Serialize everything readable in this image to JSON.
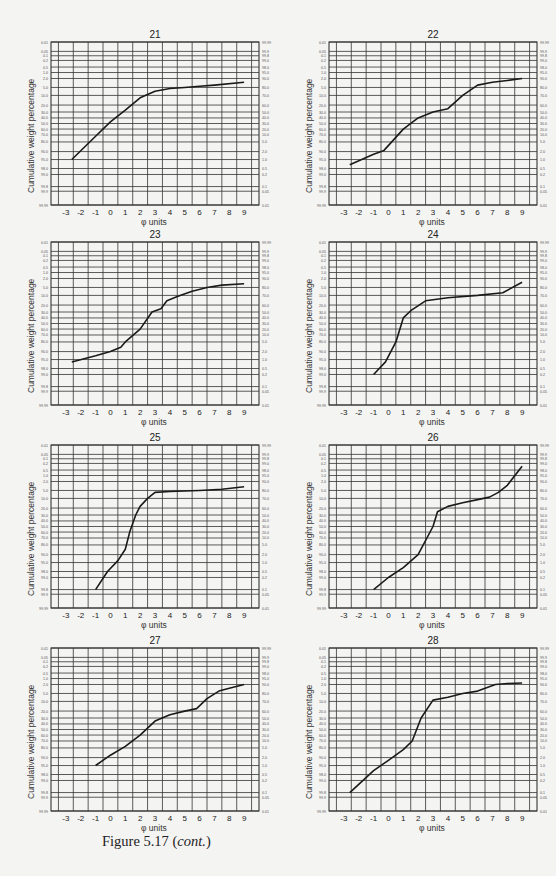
{
  "figure": {
    "caption_main": "Figure 5.17 (",
    "caption_italic": "cont.",
    "caption_end": ")",
    "colors": {
      "background": "#f4f4f2",
      "grid": "#333333",
      "curve": "#1a1a1a"
    }
  },
  "axes_common": {
    "ylabel": "Cumulative weight percentage",
    "xlabel": "φ units",
    "x_ticks": [
      -3,
      -2,
      -1,
      0,
      1,
      2,
      3,
      4,
      5,
      6,
      7,
      8,
      9
    ],
    "x_range": [
      -4,
      10
    ],
    "left_ticks": [
      "0.01",
      "0.05",
      "0.1",
      "0.2",
      "0.5",
      "1.0",
      "2.0",
      "5.0",
      "10.0",
      "20.0",
      "30.0",
      "40.0",
      "50.0",
      "60.0",
      "70.0",
      "80.0",
      "90.0",
      "95.0",
      "98.0",
      "99.0",
      "99.8",
      "99.9",
      "99.99"
    ],
    "right_ticks": [
      "99.99",
      "99.9",
      "99.8",
      "99.0",
      "98.0",
      "95.0",
      "90.0",
      "80.0",
      "70.0",
      "60.0",
      "50.0",
      "40.0",
      "30.0",
      "20.0",
      "10.0",
      "5.0",
      "2.0",
      "1.0",
      "0.5",
      "0.2",
      "0.1",
      "0.05",
      "0.01"
    ],
    "grid": true,
    "scale": "probability"
  },
  "chart_data": [
    {
      "type": "line",
      "title": "21",
      "xlabel": "φ units",
      "ylabel": "Cumulative weight percentage",
      "x": [
        -2.6,
        -1,
        0,
        1,
        2,
        3,
        4,
        5,
        6,
        7,
        9
      ],
      "values": [
        95,
        72,
        47,
        27,
        12,
        7,
        5.5,
        5,
        4.5,
        4,
        3
      ]
    },
    {
      "type": "line",
      "title": "22",
      "xlabel": "φ units",
      "ylabel": "Cumulative weight percentage",
      "x": [
        -2.6,
        -1,
        -0.3,
        1,
        2,
        3,
        4,
        5,
        6,
        7,
        8,
        9
      ],
      "values": [
        97,
        92,
        89,
        60,
        40,
        30,
        25,
        10,
        4,
        3,
        2.5,
        2
      ]
    },
    {
      "type": "line",
      "title": "23",
      "xlabel": "φ units",
      "ylabel": "Cumulative weight percentage",
      "x": [
        -2.6,
        -1,
        0,
        0.7,
        1,
        2,
        2.8,
        3.4,
        3.8,
        4.5,
        5.5,
        6.5,
        7.5,
        9
      ],
      "values": [
        96,
        93,
        90,
        86,
        80,
        60,
        30,
        25,
        15,
        11,
        7,
        5,
        4,
        3.5
      ]
    },
    {
      "type": "line",
      "title": "24",
      "xlabel": "φ units",
      "ylabel": "Cumulative weight percentage",
      "x": [
        -1,
        -0.2,
        0.5,
        1,
        1.5,
        2.5,
        4,
        6,
        7.7,
        9
      ],
      "values": [
        99,
        96,
        80,
        40,
        28,
        15,
        12,
        10,
        8,
        3
      ]
    },
    {
      "type": "line",
      "title": "25",
      "xlabel": "φ units",
      "ylabel": "Cumulative weight percentage",
      "x": [
        -1,
        -0.2,
        0.5,
        1,
        1.3,
        1.7,
        2,
        2.5,
        3,
        4,
        6,
        7.5,
        9
      ],
      "values": [
        99.8,
        98,
        94,
        85,
        60,
        30,
        18,
        10,
        6,
        5.5,
        5,
        4.5,
        3.5
      ]
    },
    {
      "type": "line",
      "title": "26",
      "xlabel": "φ units",
      "ylabel": "Cumulative weight percentage",
      "x": [
        -1,
        0,
        1,
        2,
        3,
        3.3,
        4,
        5,
        6,
        6.8,
        7.4,
        8,
        9
      ],
      "values": [
        99.8,
        99,
        97,
        90,
        50,
        25,
        18,
        14,
        11,
        9,
        6,
        3,
        0.3
      ]
    },
    {
      "type": "line",
      "title": "27",
      "xlabel": "φ units",
      "ylabel": "Cumulative weight percentage",
      "x": [
        -1,
        0,
        1,
        2,
        3,
        4,
        5,
        5.8,
        6.5,
        7.3,
        8,
        9
      ],
      "values": [
        95,
        88,
        78,
        60,
        35,
        25,
        20,
        17,
        8,
        4,
        3,
        2
      ]
    },
    {
      "type": "line",
      "title": "28",
      "xlabel": "φ units",
      "ylabel": "Cumulative weight percentage",
      "x": [
        -2.6,
        -1,
        0,
        1,
        1.6,
        2.2,
        3,
        4,
        5,
        6,
        7.2,
        8,
        9
      ],
      "values": [
        99.8,
        97,
        92,
        82,
        70,
        30,
        9,
        7,
        5,
        4,
        2,
        1.8,
        1.7
      ]
    }
  ]
}
